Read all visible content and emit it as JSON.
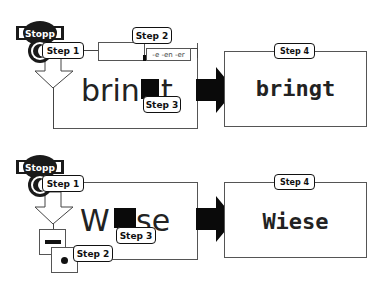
{
  "diagram": {
    "rows": [
      {
        "id": "top",
        "stamp_label": "Stopp",
        "step1_label": "Step 1",
        "step2_label": "Step 2",
        "step3_label": "Step 3",
        "step4_label": "Step 4",
        "word_prefix": "brin",
        "word_suffix_letter": "t",
        "suffix_options": "-e -en -er",
        "result_word": "bringt"
      },
      {
        "id": "bottom",
        "stamp_label": "Stopp",
        "step1_label": "Step 1",
        "step2_label": "Step 2",
        "step3_label": "Step 3",
        "step4_label": "Step 4",
        "word_prefix": "W",
        "word_suffix": "se",
        "option_dash": "—",
        "option_dot": "●",
        "result_word": "Wiese"
      }
    ],
    "colors": {
      "ink": "#111111",
      "line": "#555555",
      "background": "#ffffff"
    }
  }
}
